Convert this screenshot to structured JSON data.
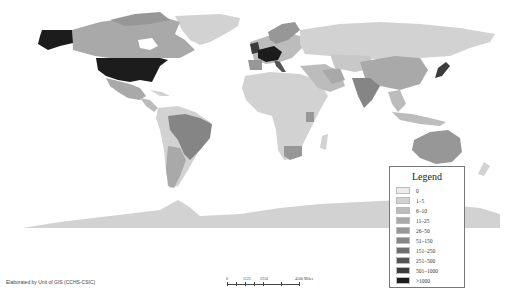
{
  "map": {
    "type": "choropleth-world",
    "colors": {
      "c0": "#ececec",
      "c1": "#d2d2d2",
      "c2": "#bcbcbc",
      "c3": "#a9a9a9",
      "c4": "#979797",
      "c5": "#858585",
      "c6": "#6e6e6e",
      "c7": "#555555",
      "c8": "#3b3b3b",
      "c9": "#1c1c1c"
    }
  },
  "legend": {
    "title": "Legend",
    "items": [
      {
        "label": "0",
        "color": "#ececec"
      },
      {
        "label": "1–5",
        "color": "#d2d2d2"
      },
      {
        "label": "6–10",
        "color": "#bcbcbc"
      },
      {
        "label": "11–25",
        "color": "#a9a9a9"
      },
      {
        "label": "26–50",
        "color": "#979797"
      },
      {
        "label": "51–150",
        "color": "#858585"
      },
      {
        "label": "151–250",
        "color": "#6e6e6e"
      },
      {
        "label": "251–500",
        "color": "#555555"
      },
      {
        "label": "501–1000",
        "color": "#3b3b3b"
      },
      {
        "label": ">1000",
        "color": "#1c1c1c"
      }
    ]
  },
  "scale": {
    "labels": [
      "0",
      "1125",
      "2250",
      "4500 Miles"
    ]
  },
  "credit": "Elaborated by Unit of GIS (CCHS-CSIC)"
}
